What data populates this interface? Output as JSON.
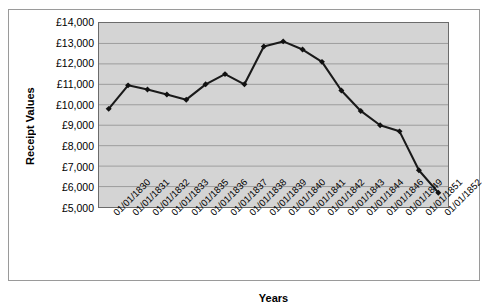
{
  "chart_data": {
    "type": "line",
    "title": "",
    "xlabel": "Years",
    "ylabel": "Receipt Values",
    "ylim": [
      5000,
      14000
    ],
    "ytick_step": 1000,
    "grid": true,
    "legend": "none",
    "marker": "diamond",
    "plot_background": "#d4d4d4",
    "line_color": "#1a1a1a",
    "categories": [
      "01/01/1830",
      "01/01/1831",
      "01/01/1832",
      "01/01/1833",
      "01/01/1835",
      "01/01/1836",
      "01/01/1837",
      "01/01/1838",
      "01/01/1839",
      "01/01/1840",
      "01/01/1841",
      "01/01/1842",
      "01/01/1843",
      "01/01/1844",
      "01/01/1846",
      "01/01/1849",
      "01/01/1851",
      "01/01/1852"
    ],
    "values": [
      9800,
      10950,
      10750,
      10500,
      10250,
      11000,
      11500,
      11000,
      12850,
      13100,
      12700,
      12100,
      10700,
      9700,
      9000,
      8700,
      6800,
      5700
    ],
    "ytick_labels": [
      "£14,000",
      "£13,000",
      "£12,000",
      "£11,000",
      "£10,000",
      "£9,000",
      "£8,000",
      "£7,000",
      "£6,000",
      "£5,000"
    ],
    "ytick_values": [
      14000,
      13000,
      12000,
      11000,
      10000,
      9000,
      8000,
      7000,
      6000,
      5000
    ]
  }
}
